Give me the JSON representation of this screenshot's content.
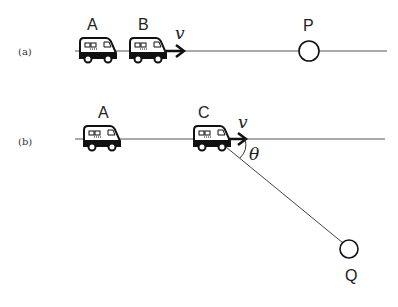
{
  "figure": {
    "panel_a": {
      "label": "(a)",
      "cars": [
        {
          "name": "A"
        },
        {
          "name": "B"
        }
      ],
      "velocity": "v",
      "point": "P"
    },
    "panel_b": {
      "label": "(b)",
      "cars": [
        {
          "name": "A"
        },
        {
          "name": "C"
        }
      ],
      "velocity": "v",
      "angle": "θ",
      "point": "Q"
    }
  }
}
